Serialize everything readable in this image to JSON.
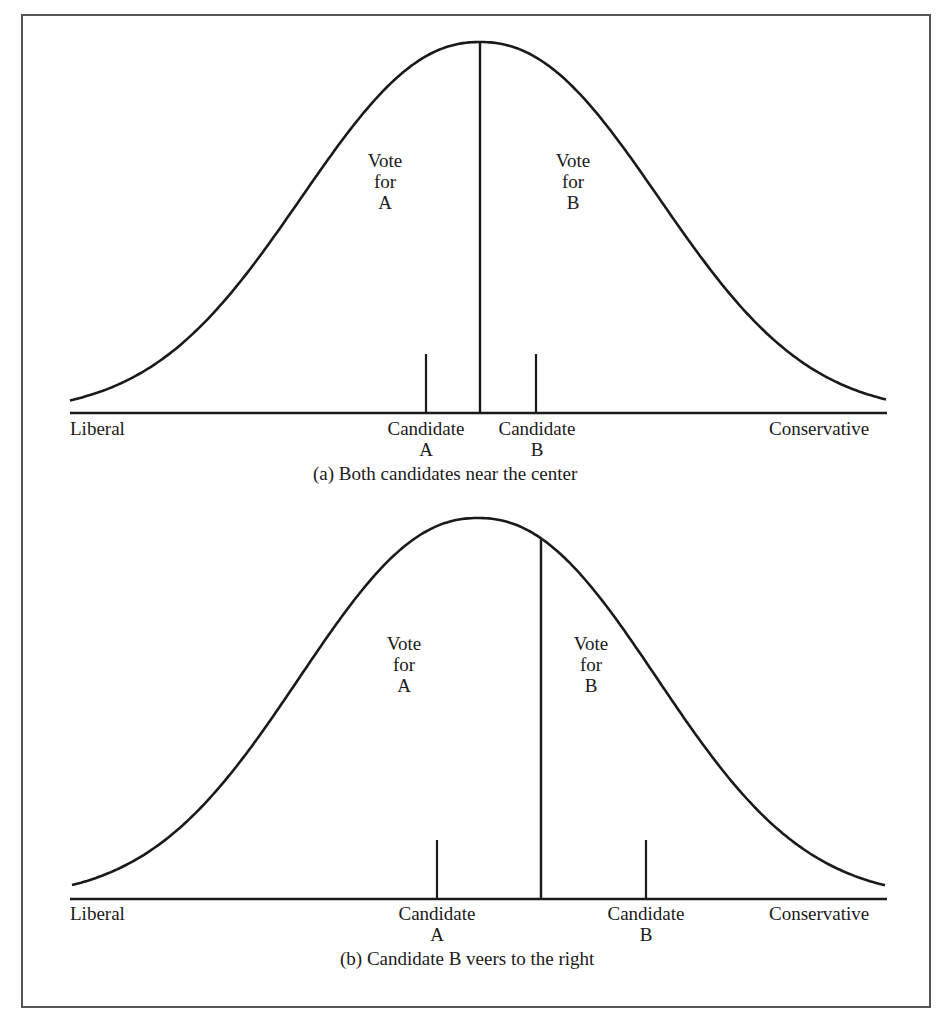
{
  "panels": [
    {
      "id": "a",
      "caption": "(a)  Both candidates near the center",
      "axis_left": "Liberal",
      "axis_right": "Conservative",
      "vote_a": [
        "Vote",
        "for",
        "A"
      ],
      "vote_b": [
        "Vote",
        "for",
        "B"
      ],
      "candidate_a": [
        "Candidate",
        "A"
      ],
      "candidate_b": [
        "Candidate",
        "B"
      ]
    },
    {
      "id": "b",
      "caption": "(b) Candidate B veers to the right",
      "axis_left": "Liberal",
      "axis_right": "Conservative",
      "vote_a": [
        "Vote",
        "for",
        "A"
      ],
      "vote_b": [
        "Vote",
        "for",
        "B"
      ],
      "candidate_a": [
        "Candidate",
        "A"
      ],
      "candidate_b": [
        "Candidate",
        "B"
      ]
    }
  ],
  "colors": {
    "ink": "#1a1a1a",
    "frame": "#555555"
  }
}
